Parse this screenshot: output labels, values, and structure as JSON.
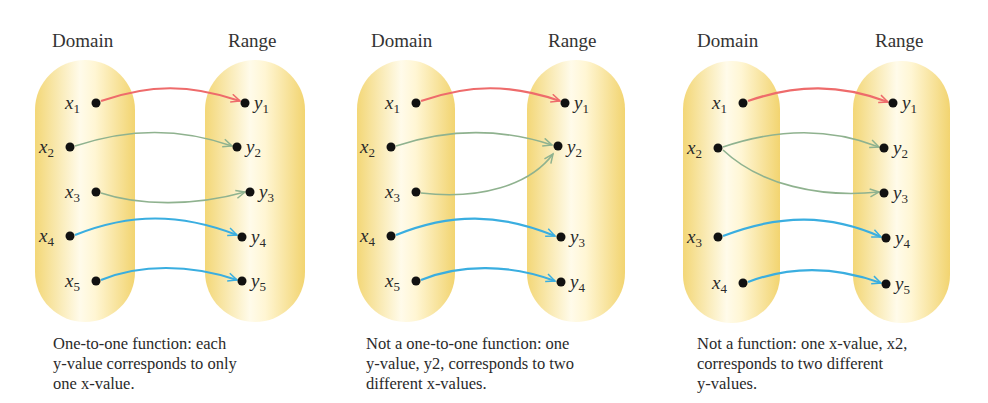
{
  "colors": {
    "oval_edge": "#f3d777",
    "oval_center": "#fffbe8",
    "arrow_red": "#ee6b6b",
    "arrow_green": "#8fb28f",
    "arrow_blue": "#3aaee0",
    "dot": "#111111"
  },
  "diagrams": [
    {
      "domain_label": "Domain",
      "range_label": "Range",
      "domain_elements": [
        "x1",
        "x2",
        "x3",
        "x4",
        "x5"
      ],
      "range_elements": [
        "y1",
        "y2",
        "y3",
        "y4",
        "y5"
      ],
      "mappings": [
        [
          "x1",
          "y1",
          "red"
        ],
        [
          "x2",
          "y2",
          "green"
        ],
        [
          "x3",
          "y3",
          "green"
        ],
        [
          "x4",
          "y4",
          "blue"
        ],
        [
          "x5",
          "y5",
          "blue"
        ]
      ],
      "caption_lines": [
        "One-to-one function: each",
        "y-value corresponds to only",
        "one x-value."
      ]
    },
    {
      "domain_label": "Domain",
      "range_label": "Range",
      "domain_elements": [
        "x1",
        "x2",
        "x3",
        "x4",
        "x5"
      ],
      "range_elements": [
        "y1",
        "y2",
        "y3",
        "y4"
      ],
      "mappings": [
        [
          "x1",
          "y1",
          "red"
        ],
        [
          "x2",
          "y2",
          "green"
        ],
        [
          "x3",
          "y2",
          "green"
        ],
        [
          "x4",
          "y3",
          "blue"
        ],
        [
          "x5",
          "y4",
          "blue"
        ]
      ],
      "caption_lines": [
        "Not a one-to-one function: one",
        "y-value, y2, corresponds to two",
        "different x-values."
      ]
    },
    {
      "domain_label": "Domain",
      "range_label": "Range",
      "domain_elements": [
        "x1",
        "x2",
        "x3",
        "x4"
      ],
      "range_elements": [
        "y1",
        "y2",
        "y3",
        "y4",
        "y5"
      ],
      "mappings": [
        [
          "x1",
          "y1",
          "red"
        ],
        [
          "x2",
          "y2",
          "green"
        ],
        [
          "x2",
          "y3",
          "green"
        ],
        [
          "x3",
          "y4",
          "blue"
        ],
        [
          "x4",
          "y5",
          "blue"
        ]
      ],
      "caption_lines": [
        "Not a function: one x-value, x2,",
        "corresponds to two different",
        "y-values."
      ]
    }
  ]
}
